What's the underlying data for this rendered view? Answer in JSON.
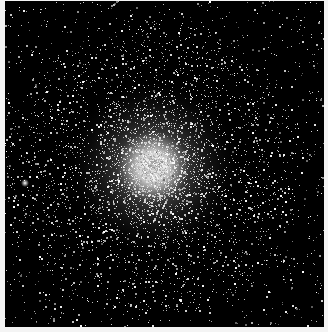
{
  "image": {
    "subject": "globular star cluster",
    "description": "Black-and-white astronomical photograph of a dense globular cluster of stars against a black sky",
    "colors": {
      "background": "#000000",
      "stars": "#ffffff",
      "border": "#f4f4f4"
    },
    "core": {
      "cx": 153,
      "cy": 167,
      "radius": 22
    },
    "bright_star": {
      "x": 25,
      "y": 183
    }
  }
}
